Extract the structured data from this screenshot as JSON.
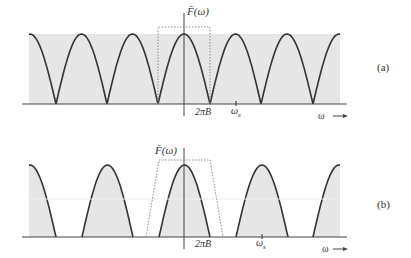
{
  "figure": {
    "panels": [
      {
        "id": "a",
        "label": "(a)",
        "y_axis_label": "F̄(ω)",
        "x_axis_label": "ω",
        "tick_labels": {
          "bandwidth": "2πB",
          "sampling": "ω",
          "sampling_sub": "s"
        },
        "description": "Spectrum of sampled signal, adjacent replicas touching (ωs = 2·2πB); dotted ideal lowpass filter box",
        "baseline_y": 104,
        "peak_y": 34,
        "axis_x": 184,
        "fill_left": 29,
        "fill_right": 340,
        "lobes": [
          [
            4,
            56
          ],
          [
            56,
            107
          ],
          [
            107,
            158
          ],
          [
            158,
            210
          ],
          [
            210,
            261
          ],
          [
            261,
            313
          ],
          [
            313,
            365
          ]
        ],
        "filter": {
          "type": "rect",
          "x1": 158,
          "x2": 210,
          "top": 27
        },
        "bandwidth_x": 210,
        "sampling_x": 236
      },
      {
        "id": "b",
        "label": "(b)",
        "y_axis_label": "F̄(ω)",
        "x_axis_label": "ω",
        "tick_labels": {
          "bandwidth": "2πB",
          "sampling": "ω",
          "sampling_sub": "s"
        },
        "description": "Oversampled spectrum with gaps between replicas; dotted practical (trapezoidal) filter",
        "baseline_y": 237,
        "peak_y": 165,
        "axis_x": 184,
        "fill_left": 29,
        "fill_right": 340,
        "lobes": [
          [
            4,
            56
          ],
          [
            82,
            133
          ],
          [
            159,
            210
          ],
          [
            236,
            288
          ],
          [
            313,
            365
          ]
        ],
        "filter": {
          "type": "trapezoid",
          "base_left": 146,
          "top_left": 159,
          "top_right": 210,
          "base_right": 223,
          "top": 160
        },
        "bandwidth_x": 210,
        "sampling_x": 262
      }
    ]
  },
  "colors": {
    "fill": "#e6e6e6",
    "curve": "#333333",
    "axis": "#444444",
    "filter": "#8a8a8a"
  }
}
